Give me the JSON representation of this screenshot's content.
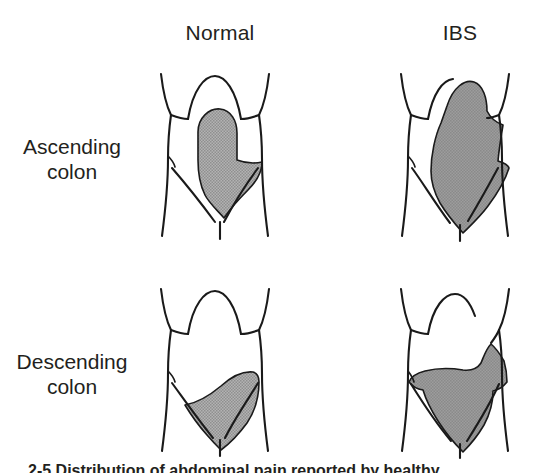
{
  "columns": {
    "normal_label": "Normal",
    "ibs_label": "IBS"
  },
  "rows": [
    {
      "line1": "Ascending",
      "line2": "colon"
    },
    {
      "line1": "Descending",
      "line2": "colon"
    }
  ],
  "caption": {
    "text": "2-5 Distribution of abdominal pain reported by healthy",
    "note": "clipped"
  },
  "colors": {
    "stroke": "#1a1a1a",
    "pain_fill": "#a6a6a6",
    "background": "#ffffff",
    "text": "#231f20"
  },
  "panels": [
    {
      "id": "normal-ascending",
      "column": "Normal",
      "row": "Ascending colon",
      "region": "right-upper-to-mid abdomen, vertical band"
    },
    {
      "id": "ibs-ascending",
      "column": "IBS",
      "row": "Ascending colon",
      "region": "broad whole-abdomen band, epigastrium to suprapubic"
    },
    {
      "id": "normal-descending",
      "column": "Normal",
      "row": "Descending colon",
      "region": "left-lower quadrant teardrop"
    },
    {
      "id": "ibs-descending",
      "column": "IBS",
      "row": "Descending colon",
      "region": "wide lower abdomen plus left flank extension"
    }
  ]
}
